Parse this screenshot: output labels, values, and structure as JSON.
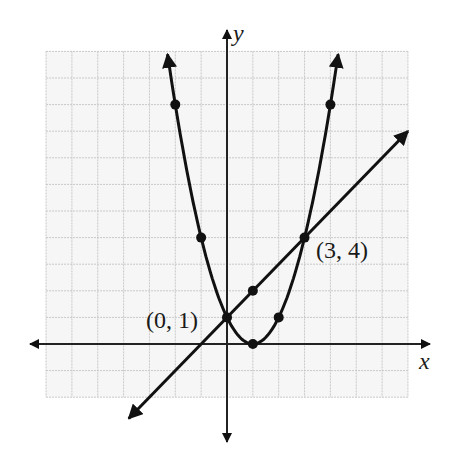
{
  "chart_data": {
    "type": "line",
    "title": "",
    "xlabel": "x",
    "ylabel": "y",
    "xlim": [
      -7,
      7
    ],
    "ylim": [
      -2,
      11
    ],
    "grid": true,
    "grid_step": 1,
    "tick_labels": false,
    "legend": null,
    "series": [
      {
        "name": "parabola",
        "equation": "y = (x - 1)^2",
        "x_range": [
          -2.3,
          4.3
        ],
        "arrows": "both",
        "marked_points": [
          {
            "x": -2,
            "y": 9
          },
          {
            "x": -1,
            "y": 4
          },
          {
            "x": 0,
            "y": 1
          },
          {
            "x": 1,
            "y": 0
          },
          {
            "x": 2,
            "y": 1
          },
          {
            "x": 3,
            "y": 4
          },
          {
            "x": 4,
            "y": 9
          }
        ]
      },
      {
        "name": "line",
        "equation": "y = x + 1",
        "x_range": [
          -3.8,
          7.0
        ],
        "arrows": "both",
        "marked_points": [
          {
            "x": 0,
            "y": 1
          },
          {
            "x": 1,
            "y": 2
          },
          {
            "x": 3,
            "y": 4
          }
        ]
      }
    ],
    "annotations": [
      {
        "text": "(0, 1)",
        "x": 0,
        "y": 1,
        "position": "left"
      },
      {
        "text": "(3, 4)",
        "x": 3,
        "y": 4,
        "position": "right"
      }
    ]
  },
  "labels": {
    "x_axis": "x",
    "y_axis": "y",
    "point_a": "(0, 1)",
    "point_b": "(3, 4)"
  },
  "colors": {
    "grid_minor": "#c8c8c8",
    "grid_background": "#f6f6f6",
    "curve": "#111111",
    "axis": "#222222"
  }
}
